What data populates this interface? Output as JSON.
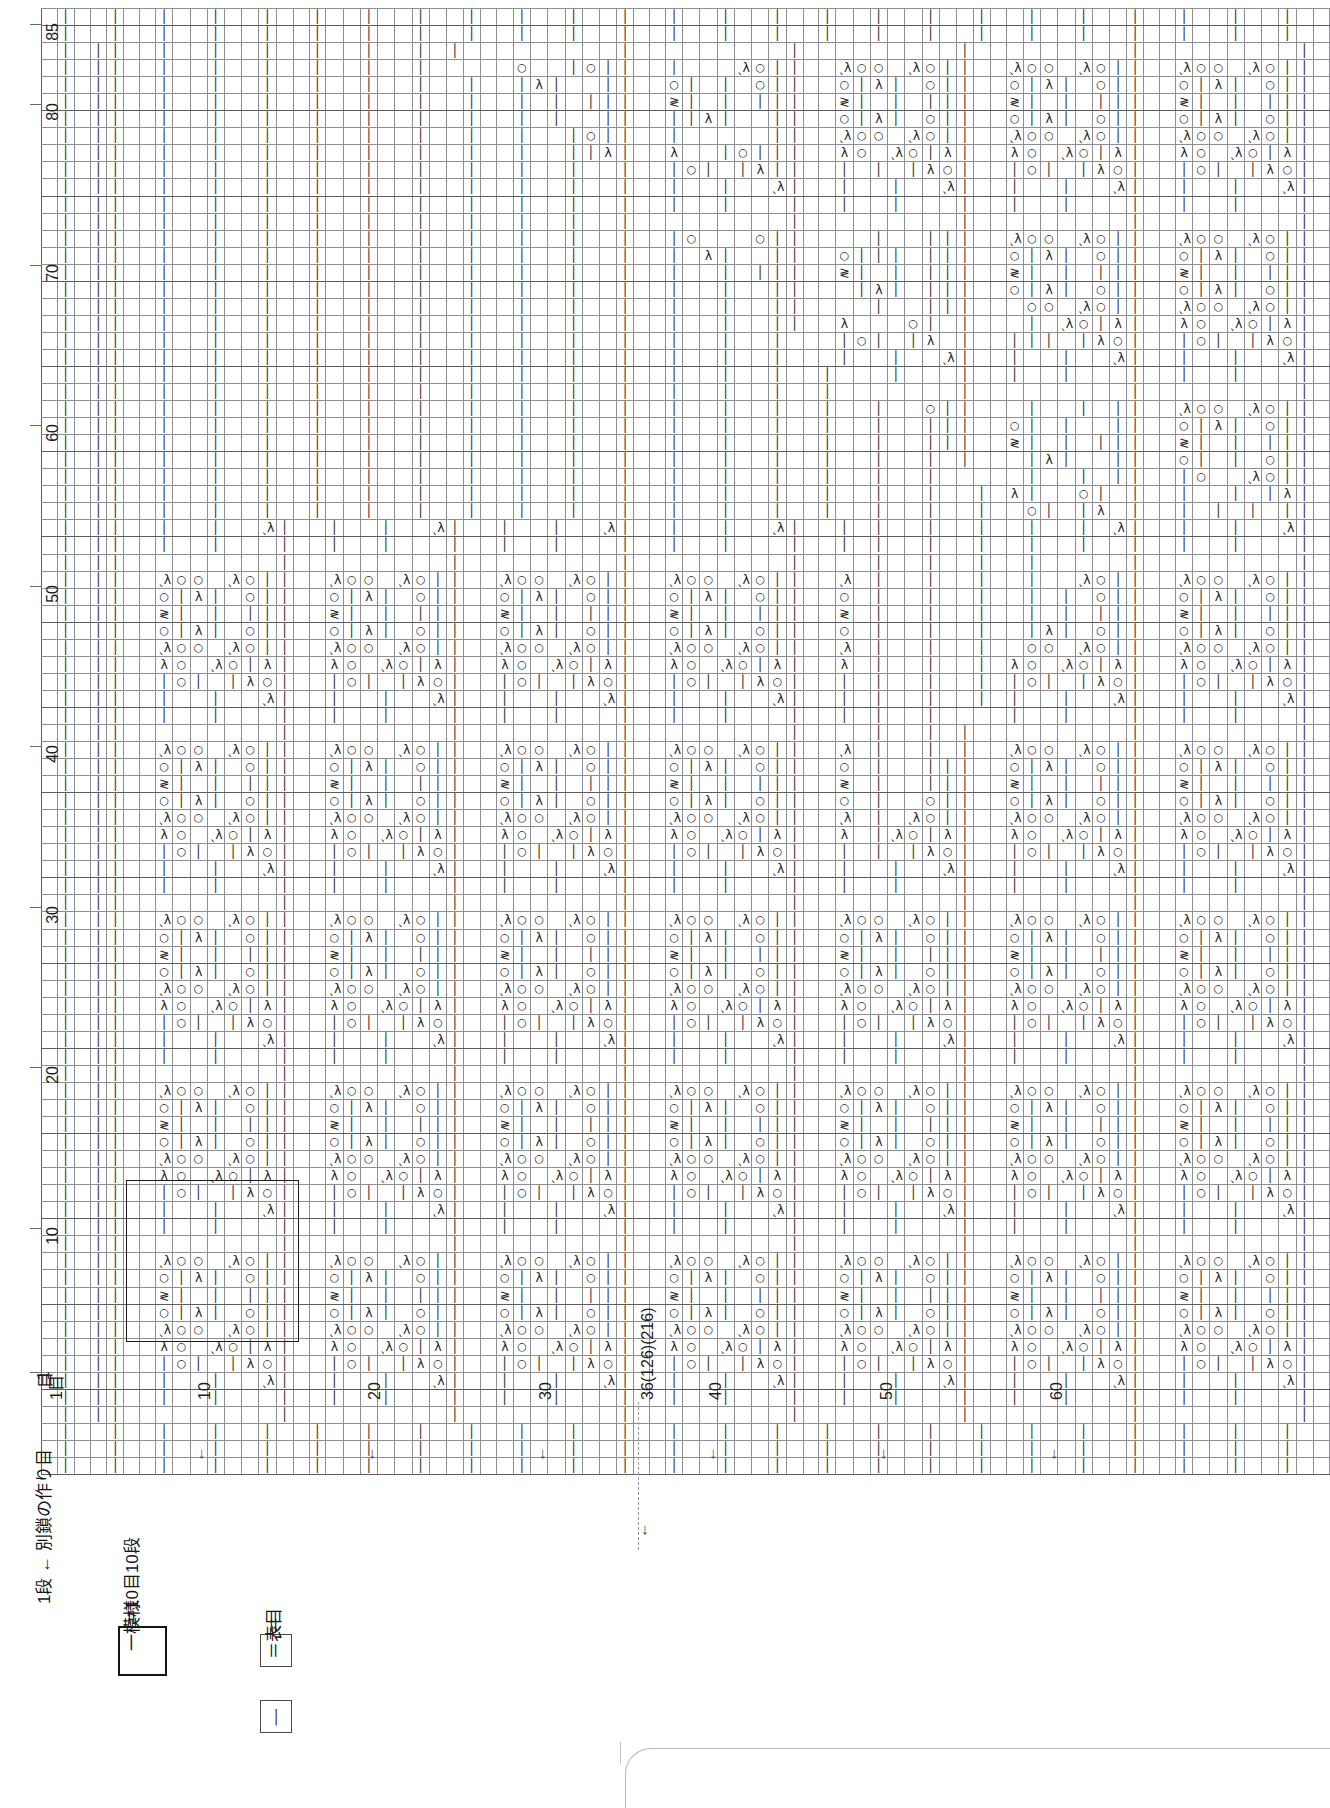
{
  "document": {
    "type": "japanese-knitting-stitch-chart",
    "title": "Lace knitting pattern chart"
  },
  "axes": {
    "left": {
      "unit": "段",
      "ticks": [
        {
          "label": "85",
          "row": 85
        },
        {
          "label": "80",
          "row": 80
        },
        {
          "label": "70",
          "row": 70
        },
        {
          "label": "60",
          "row": 60
        },
        {
          "label": "50",
          "row": 50
        },
        {
          "label": "40",
          "row": 40
        },
        {
          "label": "30",
          "row": 30
        },
        {
          "label": "20",
          "row": 20
        },
        {
          "label": "10",
          "row": 10
        },
        {
          "label": "1",
          "row": 1
        }
      ],
      "origin_label": "目"
    },
    "bottom": {
      "unit": "目",
      "ticks": [
        {
          "label": "1目",
          "col": 1,
          "arrow": ""
        },
        {
          "label": "10",
          "col": 10,
          "arrow": "↓"
        },
        {
          "label": "20",
          "col": 20,
          "arrow": "↓"
        },
        {
          "label": "30",
          "col": 30,
          "arrow": "↓"
        },
        {
          "label": "36(126)(216)",
          "col": 36,
          "arrow": "↓"
        },
        {
          "label": "40",
          "col": 40,
          "arrow": "↓"
        },
        {
          "label": "50",
          "col": 50,
          "arrow": "↓"
        },
        {
          "label": "60",
          "col": 60,
          "arrow": "↓"
        }
      ]
    }
  },
  "legend": {
    "cast_on": "1段 ← 別鎖の作り目",
    "repeat_line1": "＝10目10段",
    "repeat_line2": "一模様",
    "stitch_eq1": "＝",
    "stitch_symbol": "│",
    "stitch_eq2": "＝表目"
  },
  "symbols": {
    "k": "│",
    "yo": "○",
    "dec_left": "λ",
    "dec_right": "ˎλ",
    "dec_center": "≷",
    "blank": ""
  },
  "symbol_names": {
    "k": "knit-stitch",
    "yo": "yarn-over",
    "dec_left": "left-leaning-decrease",
    "dec_right": "right-leaning-decrease",
    "dec_center": "central-double-decrease",
    "blank": "no-stitch"
  },
  "grid": {
    "columns": 76,
    "rows": 86,
    "cell_width_px": 17.05,
    "cell_height_px": 16.05,
    "repeat_box": {
      "col_start": 6,
      "col_end": 15,
      "row_start": 4,
      "row_end": 13
    }
  },
  "chart_data": {
    "type": "heatmap",
    "xlabel": "目 (stitches)",
    "ylabel": "段 (rows)",
    "xlim": [
      1,
      76
    ],
    "ylim": [
      1,
      86
    ],
    "grid": true,
    "legend_position": "bottom-left",
    "motif": {
      "period_cols": 10,
      "period_rows": 10,
      "description": "10 stitch x 10 row lace repeat",
      "base_tile": [
        [
          "k",
          "",
          "",
          "",
          "",
          "",
          "",
          "",
          "",
          ""
        ],
        [
          "k",
          "",
          "",
          "k",
          "",
          "",
          "k",
          "",
          "",
          ""
        ],
        [
          "k",
          "",
          "",
          "k",
          "",
          "",
          "k",
          "",
          "",
          "dec_right"
        ],
        [
          "k",
          "",
          "",
          "k",
          "yo",
          "k",
          "",
          "k",
          "dec_left",
          "yo"
        ],
        [
          "k",
          "",
          "",
          "dec_left",
          "yo",
          "",
          "dec_right",
          "yo",
          "k",
          "dec_left"
        ],
        [
          "k",
          "",
          "",
          "dec_right",
          "yo",
          "yo",
          "",
          "dec_right",
          "yo",
          "k"
        ],
        [
          "k",
          "",
          "",
          "yo",
          "k",
          "dec_left",
          "k",
          "",
          "yo",
          "k"
        ],
        [
          "k",
          "",
          "",
          "dec_center",
          "k",
          "",
          "k",
          "",
          "k",
          "k"
        ],
        [
          "k",
          "",
          "",
          "yo",
          "k",
          "dec_left",
          "k",
          "",
          "yo",
          "k"
        ],
        [
          "k",
          "",
          "",
          "dec_right",
          "yo",
          "yo",
          "",
          "dec_right",
          "yo",
          "k"
        ]
      ]
    }
  }
}
